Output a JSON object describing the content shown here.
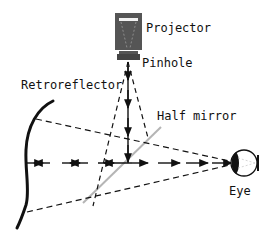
{
  "diagram": {
    "labels": {
      "projector": "Projector",
      "pinhole": "Pinhole",
      "retroreflector": "Retroreflector",
      "half_mirror": "Half mirror",
      "eye": "Eye"
    },
    "colors": {
      "ink": "#111111",
      "projector_body": "#555555",
      "mirror": "#b5b5b5",
      "background": "#ffffff"
    }
  }
}
